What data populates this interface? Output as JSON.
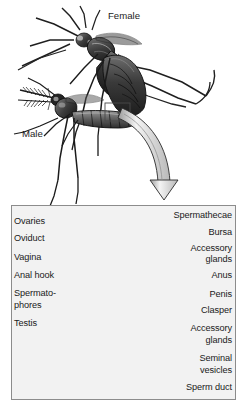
{
  "figure": {
    "title_labels": [
      {
        "name": "female-label",
        "text": "Female",
        "x": 108,
        "y": 16
      },
      {
        "name": "male-label",
        "text": "Male",
        "x": 22,
        "y": 133
      }
    ],
    "top_illustration": {
      "description": "mating-mosquito-pair-illustration",
      "highlight_box": {
        "x": 105,
        "y": 103,
        "w": 24,
        "h": 17
      },
      "arrow": {
        "name": "curved-down-arrow",
        "from_x": 117,
        "from_y": 118,
        "to_x": 158,
        "to_y": 200
      }
    },
    "detail_panel": {
      "name": "genitalia-detail-panel",
      "x": 11,
      "y": 205,
      "w": 225,
      "h": 195,
      "left_labels": [
        {
          "name": "label-ovaries",
          "text": "Ovaries",
          "x": 14,
          "y": 221,
          "leader": [
            [
              52,
              226
            ],
            [
              66,
              221
            ]
          ]
        },
        {
          "name": "label-oviduct",
          "text": "Oviduct",
          "x": 14,
          "y": 238,
          "leader": [
            [
              52,
              243
            ],
            [
              72,
              250
            ]
          ]
        },
        {
          "name": "label-vagina",
          "text": "Vagina",
          "x": 14,
          "y": 257,
          "leader": [
            [
              50,
              262
            ],
            [
              78,
              275
            ]
          ]
        },
        {
          "name": "label-anal-hook",
          "text": "Anal hook",
          "x": 14,
          "y": 275,
          "leader": [
            [
              62,
              280
            ],
            [
              86,
              292
            ]
          ]
        },
        {
          "name": "label-spermatophores-line1",
          "text": "Spermato-",
          "x": 14,
          "y": 293,
          "leader": null
        },
        {
          "name": "label-spermatophores-line2",
          "text": "phores",
          "x": 14,
          "y": 305,
          "leader": [
            [
              52,
              310
            ],
            [
              112,
              305
            ]
          ]
        },
        {
          "name": "label-testis",
          "text": "Testis",
          "x": 14,
          "y": 323,
          "leader": [
            [
              30,
              334
            ],
            [
              40,
              360
            ]
          ]
        }
      ],
      "right_labels": [
        {
          "name": "label-spermathecae",
          "text": "Spermathecae",
          "x": 232,
          "y": 215,
          "leader": [
            [
              162,
              220
            ],
            [
              150,
              228
            ]
          ]
        },
        {
          "name": "label-bursa",
          "text": "Bursa",
          "x": 232,
          "y": 232,
          "leader": [
            [
              195,
              237
            ],
            [
              132,
              248
            ]
          ]
        },
        {
          "name": "label-accessory-glands-1-line1",
          "text": "Accessory",
          "x": 232,
          "y": 248,
          "leader": [
            [
              175,
              253
            ],
            [
              128,
              262
            ]
          ]
        },
        {
          "name": "label-accessory-glands-1-line2",
          "text": "glands",
          "x": 232,
          "y": 259,
          "leader": null
        },
        {
          "name": "label-anus",
          "text": "Anus",
          "x": 232,
          "y": 275,
          "leader": [
            [
              198,
              280
            ],
            [
              160,
              296
            ]
          ]
        },
        {
          "name": "label-penis",
          "text": "Penis",
          "x": 232,
          "y": 294,
          "leader": [
            [
              196,
              299
            ],
            [
              152,
              312
            ]
          ]
        },
        {
          "name": "label-clasper",
          "text": "Clasper",
          "x": 232,
          "y": 310,
          "leader": [
            [
              190,
              315
            ],
            [
              156,
              325
            ]
          ]
        },
        {
          "name": "label-accessory-glands-2-line1",
          "text": "Accessory",
          "x": 232,
          "y": 328,
          "leader": [
            [
              176,
              333
            ],
            [
              148,
              333
            ]
          ]
        },
        {
          "name": "label-accessory-glands-2-line2",
          "text": "glands",
          "x": 232,
          "y": 340,
          "leader": null
        },
        {
          "name": "label-seminal-vesicles-line1",
          "text": "Seminal",
          "x": 232,
          "y": 358,
          "leader": [
            [
              185,
              363
            ],
            [
              100,
              352
            ]
          ]
        },
        {
          "name": "label-seminal-vesicles-line2",
          "text": "vesicles",
          "x": 232,
          "y": 370,
          "leader": null
        },
        {
          "name": "label-sperm-duct",
          "text": "Sperm duct",
          "x": 232,
          "y": 387,
          "leader": [
            [
              180,
              392
            ],
            [
              78,
              380
            ]
          ]
        }
      ]
    },
    "colors": {
      "background": "#ffffff",
      "panel_background": "#f2f2f2",
      "panel_border": "#8c8c8c",
      "text": "#1a1a1a",
      "leader_line": "#5a5a5a",
      "illustration_dark": "#2b2b2b",
      "illustration_mid": "#8a8a8a",
      "illustration_light": "#cfcfcf"
    }
  }
}
